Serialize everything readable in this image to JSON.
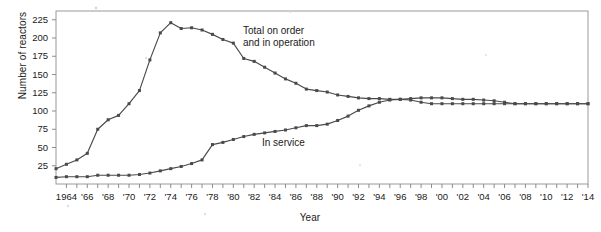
{
  "chart_data": {
    "type": "line",
    "title": "",
    "xlabel": "Year",
    "ylabel": "Number of reactors",
    "xlim": [
      1963,
      2014
    ],
    "ylim": [
      0,
      237
    ],
    "yticks": [
      25,
      50,
      75,
      100,
      125,
      150,
      175,
      200,
      225
    ],
    "xticks_major": [
      "1964",
      "'66",
      "'68",
      "'70",
      "'72",
      "'74",
      "'76",
      "'78",
      "'80",
      "'82",
      "'84",
      "'86",
      "'88",
      "'90",
      "'92",
      "'94",
      "'96",
      "'98",
      "'00",
      "'02",
      "'04",
      "'06",
      "'08",
      "'10",
      "'12",
      "'14"
    ],
    "xtick_years_major": [
      1964,
      1966,
      1968,
      1970,
      1972,
      1974,
      1976,
      1978,
      1980,
      1982,
      1984,
      1986,
      1988,
      1990,
      1992,
      1994,
      1996,
      1998,
      2000,
      2002,
      2004,
      2006,
      2008,
      2010,
      2012,
      2014
    ],
    "grid": false,
    "legend_position": "inline-annotations",
    "marker": "square",
    "line_color": "#4a4a4a",
    "x": [
      1963,
      1964,
      1965,
      1966,
      1967,
      1968,
      1969,
      1970,
      1971,
      1972,
      1973,
      1974,
      1975,
      1976,
      1977,
      1978,
      1979,
      1980,
      1981,
      1982,
      1983,
      1984,
      1985,
      1986,
      1987,
      1988,
      1989,
      1990,
      1991,
      1992,
      1993,
      1994,
      1995,
      1996,
      1997,
      1998,
      1999,
      2000,
      2001,
      2002,
      2003,
      2004,
      2005,
      2006,
      2007,
      2008,
      2009,
      2010,
      2011,
      2012,
      2013,
      2014
    ],
    "series": [
      {
        "name": "Total on order and in operation",
        "label_lines": [
          "Total on order",
          "and in operation"
        ],
        "values": [
          21,
          27,
          33,
          42,
          75,
          88,
          94,
          110,
          128,
          170,
          207,
          221,
          213,
          214,
          211,
          205,
          198,
          193,
          172,
          168,
          160,
          152,
          144,
          138,
          130,
          128,
          126,
          122,
          120,
          118,
          117,
          117,
          116,
          116,
          115,
          112,
          110,
          110,
          110,
          110,
          110,
          110,
          110,
          110,
          110,
          110,
          110,
          110,
          110,
          110,
          110,
          110
        ]
      },
      {
        "name": "In service",
        "label_lines": [
          "In service"
        ],
        "values": [
          9,
          10,
          10,
          10,
          12,
          12,
          12,
          12,
          13,
          15,
          18,
          21,
          24,
          28,
          33,
          54,
          57,
          61,
          65,
          68,
          70,
          72,
          74,
          77,
          80,
          80,
          82,
          87,
          93,
          101,
          107,
          112,
          115,
          116,
          117,
          118,
          118,
          118,
          117,
          116,
          116,
          115,
          114,
          112,
          110,
          110,
          110,
          110,
          110,
          110,
          110,
          110
        ]
      }
    ]
  },
  "annotations": {
    "total_line1": "Total on order",
    "total_line2": "and in operation",
    "in_service": "In service"
  },
  "axes": {
    "y_title": "Number of reactors",
    "x_title": "Year"
  }
}
